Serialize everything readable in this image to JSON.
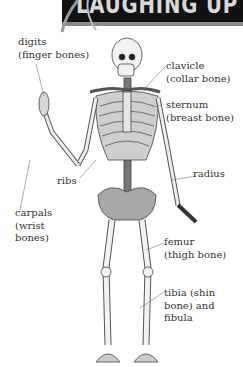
{
  "banner": {
    "title": "LAUGHING UP"
  },
  "labels": {
    "digits": [
      "digits",
      "(finger bones)"
    ],
    "clavicle": [
      "clavicle",
      "(collar bone)"
    ],
    "sternum": [
      "sternum",
      "(breast bone)"
    ],
    "ribs": [
      "ribs"
    ],
    "radius": [
      "radius"
    ],
    "carpals": [
      "carpals",
      "(wrist",
      "bones)"
    ],
    "femur": [
      "femur",
      "(thigh bone)"
    ],
    "tibia": [
      "tibia (shin",
      "bone) and",
      "fibula"
    ]
  },
  "colors": {
    "bone": "#f2f2f2",
    "outline": "#444444",
    "shade": "#8c8c8c",
    "banner": "#111111"
  }
}
